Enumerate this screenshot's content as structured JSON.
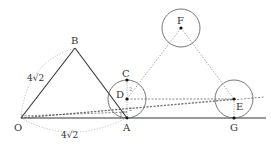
{
  "diagram": {
    "type": "geometry",
    "colors": {
      "solid_line": "#333333",
      "dashed_line": "#555555",
      "dotted_arc": "#aaaaaa",
      "circle": "#666666",
      "point": "#111111",
      "background": "#ffffff"
    },
    "points": {
      "O": {
        "label": "O",
        "x": 21,
        "y": 118
      },
      "B": {
        "label": "B",
        "x": 75,
        "y": 48
      },
      "A": {
        "label": "A",
        "x": 127,
        "y": 118
      },
      "C": {
        "label": "C",
        "x": 127,
        "y": 80
      },
      "D": {
        "label": "D",
        "x": 127,
        "y": 98
      },
      "F": {
        "label": "F",
        "x": 181,
        "y": 28
      },
      "E": {
        "label": "E",
        "x": 234,
        "y": 99
      },
      "G": {
        "label": "G",
        "x": 234,
        "y": 118
      }
    },
    "labels": {
      "O": "O",
      "B": "B",
      "A": "A",
      "C": "C",
      "D": "D",
      "F": "F",
      "E": "E",
      "G": "G",
      "side_OB": "4√2",
      "side_OA": "4√2",
      "seg_CD": "2",
      "seg_DA": "2"
    },
    "circles": [
      {
        "name": "circle-D",
        "cx": 127,
        "cy": 99,
        "r": 19
      },
      {
        "name": "circle-F",
        "cx": 181,
        "cy": 28,
        "r": 19
      },
      {
        "name": "circle-E",
        "cx": 234,
        "cy": 99,
        "r": 19
      }
    ]
  }
}
